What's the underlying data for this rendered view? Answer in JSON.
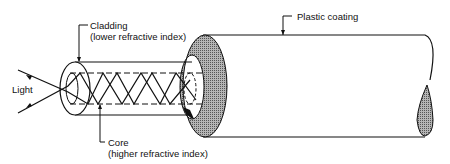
{
  "diagram": {
    "labels": {
      "cladding_line1": "Cladding",
      "cladding_line2": "(lower refractive index)",
      "plastic": "Plastic coating",
      "light": "Light",
      "core_line1": "Core",
      "core_line2": "(higher refractive index)"
    },
    "colors": {
      "stroke": "#111111",
      "hatch": "#8a8a8a",
      "background": "#ffffff"
    }
  }
}
